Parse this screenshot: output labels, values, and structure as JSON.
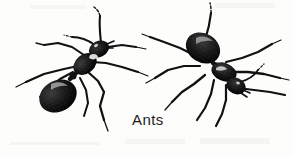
{
  "figure": {
    "caption": "Ants",
    "background_color": "#fdfdfc",
    "ink_color": "#111111",
    "width": 293,
    "height": 157,
    "style": "black-and-white scanned line drawing",
    "subjects": [
      {
        "name": "ant-left",
        "orientation": "head upper-right, abdomen lower-left",
        "parts": [
          "head",
          "mandibles",
          "antennae",
          "thorax",
          "petiole",
          "gaster",
          "six-legs"
        ]
      },
      {
        "name": "ant-right",
        "orientation": "abdomen upper-left, head lower-right",
        "parts": [
          "head",
          "mandibles",
          "antennae",
          "thorax",
          "petiole",
          "gaster",
          "six-legs"
        ]
      }
    ]
  }
}
